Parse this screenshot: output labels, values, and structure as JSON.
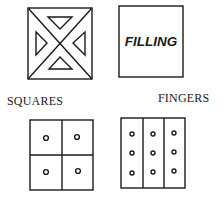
{
  "diagram": {
    "panels": [
      {
        "id": "cross-pattern",
        "label": "",
        "description": "square divided by diagonals with four inward triangles"
      },
      {
        "id": "filling",
        "label": "FILLING"
      },
      {
        "id": "squares",
        "label": "SQUARES",
        "grid": {
          "rows": 2,
          "cols": 2,
          "dots_per_cell": 1
        }
      },
      {
        "id": "fingers",
        "label": "FINGERS",
        "grid": {
          "rows": 1,
          "cols": 3,
          "dots_per_cell": 3
        }
      }
    ],
    "colors": {
      "stroke": "#1a1a1a",
      "background": "#ffffff"
    }
  }
}
